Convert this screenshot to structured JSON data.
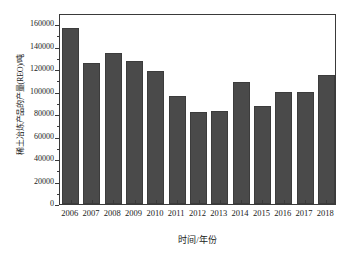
{
  "chart_data": {
    "type": "bar",
    "title": "",
    "xlabel": "时间/年份",
    "ylabel": "稀土冶炼产品的产量(REO)/吨",
    "categories": [
      "2006",
      "2007",
      "2008",
      "2009",
      "2010",
      "2011",
      "2012",
      "2013",
      "2014",
      "2015",
      "2016",
      "2017",
      "2018"
    ],
    "values": [
      157000,
      125500,
      134500,
      127000,
      118500,
      96500,
      81500,
      82500,
      109000,
      87500,
      99500,
      99500,
      114500
    ],
    "series": [
      {
        "name": "稀土冶炼产品的产量(REO)/吨",
        "values": [
          157000,
          125500,
          134500,
          127000,
          118500,
          96500,
          81500,
          82500,
          109000,
          87500,
          99500,
          99500,
          114500
        ]
      }
    ],
    "ylim": [
      0,
      170000
    ],
    "ytick_values": [
      0,
      20000,
      40000,
      60000,
      80000,
      100000,
      120000,
      140000,
      160000
    ],
    "ytick_labels": [
      "0",
      "20000",
      "40000",
      "60000",
      "80000",
      "100000",
      "120000",
      "140000",
      "160000"
    ],
    "grid": false,
    "legend": "none",
    "bar_color": "#4a4a4a",
    "axis_color": "#3a3a3a",
    "background_color": "#ffffff"
  }
}
